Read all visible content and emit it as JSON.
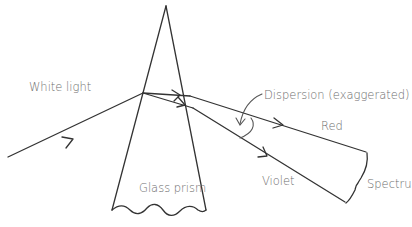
{
  "diagram": {
    "labels": {
      "incident": "White light",
      "prism": "Glass prism",
      "dispersion": "Dispersion (exaggerated)",
      "red": "Red",
      "violet": "Violet",
      "spectrum": "Spectru"
    },
    "colors": {
      "stroke": "#333333",
      "text": "#6e6e6e",
      "background": "#ffffff"
    },
    "nodes": [
      {
        "id": "incident-ray",
        "label": "White light"
      },
      {
        "id": "prism",
        "label": "Glass prism"
      },
      {
        "id": "red-ray",
        "label": "Red"
      },
      {
        "id": "violet-ray",
        "label": "Violet"
      },
      {
        "id": "dispersion-angle",
        "label": "Dispersion (exaggerated)"
      },
      {
        "id": "spectrum-bracket",
        "label": "Spectru"
      }
    ],
    "edges": [
      {
        "from": "incident-ray",
        "to": "prism"
      },
      {
        "from": "prism",
        "to": "red-ray"
      },
      {
        "from": "prism",
        "to": "violet-ray"
      },
      {
        "from": "red-ray",
        "to": "spectrum-bracket"
      },
      {
        "from": "violet-ray",
        "to": "spectrum-bracket"
      }
    ]
  }
}
